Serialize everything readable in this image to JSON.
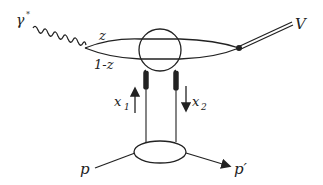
{
  "diagram": {
    "type": "feynman-diagram",
    "labels": {
      "photon": "γ",
      "photon_sup": "*",
      "quark_fraction": "z",
      "antiquark_fraction": "1-z",
      "vector_meson": "V",
      "gluon1": "x",
      "gluon1_sub": "1",
      "gluon2": "x",
      "gluon2_sub": "2",
      "proton_in": "p",
      "proton_out": "p′"
    },
    "colors": {
      "line": "#222222",
      "background": "#ffffff"
    }
  }
}
